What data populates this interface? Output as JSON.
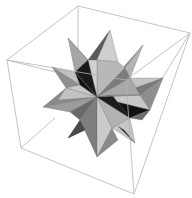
{
  "figure": {
    "title": "Great stellated dodecahedron in bounding box",
    "colors": {
      "background": "#ffffff",
      "box_edge": "#b4b4b4",
      "face_light": "#c8c8c8",
      "face_mid": "#a0a0a0",
      "face_darkmid": "#7e7e7e",
      "face_dark": "#555555",
      "face_black": "#111111"
    }
  }
}
